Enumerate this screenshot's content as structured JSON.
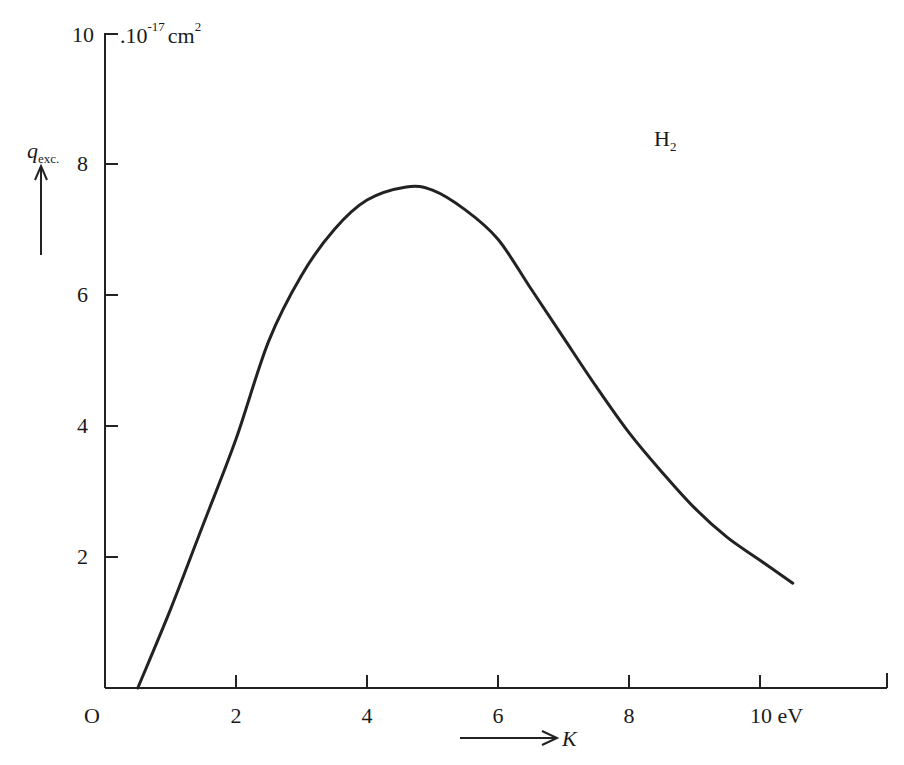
{
  "chart_data": {
    "type": "line",
    "title": "",
    "annotation": "H2",
    "xlabel": "K",
    "xunit": "eV",
    "ylabel": "q_exc.",
    "yunit": "10^-17 cm^2",
    "xlim": [
      0,
      12
    ],
    "ylim": [
      0,
      10
    ],
    "grid": false,
    "legend": null,
    "x_ticks": [
      0,
      2,
      4,
      6,
      8,
      10
    ],
    "x_tick_labels": [
      "O",
      "2",
      "4",
      "6",
      "8",
      "10 eV"
    ],
    "y_ticks": [
      2,
      4,
      6,
      8,
      10
    ],
    "y_tick_labels": [
      "2",
      "4",
      "6",
      "8",
      "10"
    ],
    "series": [
      {
        "name": "H2 excitation cross-section",
        "x": [
          0.5,
          1.0,
          1.5,
          2.0,
          2.5,
          3.0,
          3.5,
          4.0,
          4.6,
          5.0,
          5.5,
          6.0,
          6.5,
          7.0,
          7.5,
          8.0,
          8.5,
          9.0,
          9.5,
          10.0,
          10.5
        ],
        "y": [
          0.0,
          1.2,
          2.5,
          3.8,
          5.3,
          6.3,
          7.0,
          7.45,
          7.65,
          7.6,
          7.3,
          6.85,
          6.1,
          5.35,
          4.6,
          3.9,
          3.3,
          2.75,
          2.3,
          1.95,
          1.6
        ]
      }
    ]
  },
  "labels": {
    "y_top_tick": "10",
    "y_unit_prefix": ".10",
    "y_unit_exp": "-17",
    "y_unit_cm": "cm",
    "y_unit_cm_exp": "2",
    "y_axis_q": "q",
    "y_axis_sub": "exc.",
    "species": "H",
    "species_sub": "2",
    "x_axis_var": "K",
    "y_ticks": [
      "8",
      "6",
      "4",
      "2"
    ],
    "x_ticks": [
      "O",
      "2",
      "4",
      "6",
      "8",
      "10 eV"
    ]
  }
}
